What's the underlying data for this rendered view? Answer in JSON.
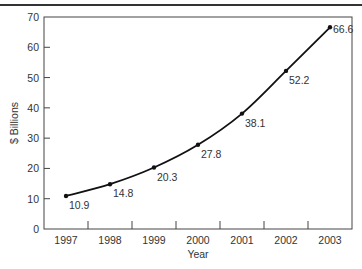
{
  "chart_data": {
    "type": "line",
    "title": "",
    "xlabel": "Year",
    "ylabel": "$ Billions",
    "categories": [
      "1997",
      "1998",
      "1999",
      "2000",
      "2001",
      "2002",
      "2003"
    ],
    "values": [
      10.9,
      14.8,
      20.3,
      27.8,
      38.1,
      52.2,
      66.6
    ],
    "data_labels": [
      "10.9",
      "14.8",
      "20.3",
      "27.8",
      "38.1",
      "52.2",
      "66.6"
    ],
    "ylim": [
      0,
      70
    ],
    "yticks": [
      0,
      10,
      20,
      30,
      40,
      50,
      60,
      70
    ],
    "grid": false,
    "legend": null,
    "series_color": "#111111"
  }
}
